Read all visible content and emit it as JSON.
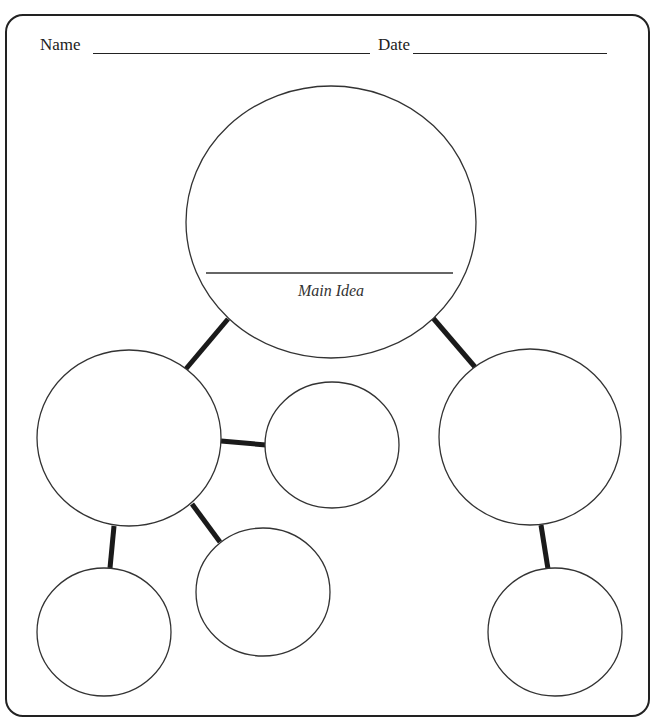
{
  "worksheet": {
    "title": "Main Idea Web Graphic Organizer",
    "fields": {
      "name_label": "Name",
      "date_label": "Date"
    },
    "main_circle": {
      "label": "Main Idea"
    },
    "nodes": [
      {
        "id": "main",
        "shape": "circle",
        "role": "main-idea"
      },
      {
        "id": "left-detail",
        "shape": "circle",
        "role": "supporting-detail"
      },
      {
        "id": "right-detail",
        "shape": "circle",
        "role": "supporting-detail"
      },
      {
        "id": "left-sub-right",
        "shape": "circle",
        "role": "sub-detail"
      },
      {
        "id": "left-sub-bottom-middle",
        "shape": "circle",
        "role": "sub-detail"
      },
      {
        "id": "left-sub-bottom-left",
        "shape": "circle",
        "role": "sub-detail"
      },
      {
        "id": "right-sub-bottom",
        "shape": "circle",
        "role": "sub-detail"
      }
    ],
    "colors": {
      "stroke": "#222222",
      "background": "#ffffff"
    }
  }
}
